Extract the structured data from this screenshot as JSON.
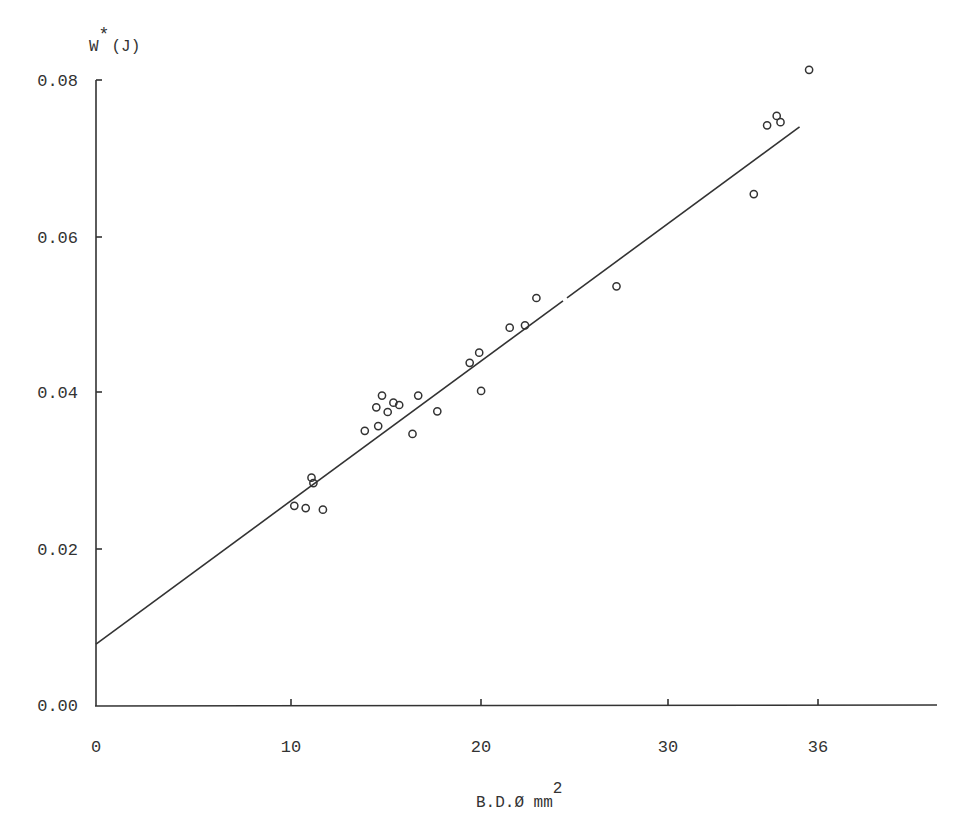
{
  "chart_data": {
    "type": "scatter",
    "title": "",
    "xlabel": "B.D.Ø mm²",
    "xlabel_main": "B.D.Ø mm",
    "xlabel_sup": "2",
    "ylabel": "W*(J)",
    "ylabel_main": "W",
    "ylabel_star": "*",
    "ylabel_unit": "(J)",
    "x_ticks": [
      {
        "label": "0",
        "value": 0,
        "px": 96
      },
      {
        "label": "10",
        "value": 10,
        "px": 291
      },
      {
        "label": "20",
        "value": 20,
        "px": 481
      },
      {
        "label": "30",
        "value": 30,
        "px": 668
      },
      {
        "label": "36",
        "value": 36,
        "px": 818
      }
    ],
    "y_ticks": [
      {
        "label": "0.00",
        "value": 0.0,
        "px": 705
      },
      {
        "label": "0.02",
        "value": 0.02,
        "px": 549
      },
      {
        "label": "0.04",
        "value": 0.04,
        "px": 392
      },
      {
        "label": "0.06",
        "value": 0.06,
        "px": 237
      },
      {
        "label": "0.08",
        "value": 0.08,
        "px": 80
      }
    ],
    "xlim": [
      0,
      44
    ],
    "ylim": [
      0.0,
      0.08
    ],
    "grid": false,
    "legend": null,
    "series": [
      {
        "name": "measurements",
        "marker": "open-circle",
        "points": [
          {
            "x": 10.4,
            "y": 0.0255
          },
          {
            "x": 11.0,
            "y": 0.0252
          },
          {
            "x": 11.9,
            "y": 0.025
          },
          {
            "x": 11.3,
            "y": 0.0291
          },
          {
            "x": 11.4,
            "y": 0.0284
          },
          {
            "x": 14.1,
            "y": 0.0351
          },
          {
            "x": 14.8,
            "y": 0.0357
          },
          {
            "x": 14.7,
            "y": 0.0381
          },
          {
            "x": 15.0,
            "y": 0.0396
          },
          {
            "x": 15.3,
            "y": 0.0375
          },
          {
            "x": 15.6,
            "y": 0.0387
          },
          {
            "x": 15.9,
            "y": 0.0384
          },
          {
            "x": 16.6,
            "y": 0.0347
          },
          {
            "x": 16.9,
            "y": 0.0396
          },
          {
            "x": 17.9,
            "y": 0.0376
          },
          {
            "x": 19.6,
            "y": 0.0438
          },
          {
            "x": 20.1,
            "y": 0.0451
          },
          {
            "x": 20.2,
            "y": 0.0402
          },
          {
            "x": 21.7,
            "y": 0.0483
          },
          {
            "x": 22.5,
            "y": 0.0486
          },
          {
            "x": 23.1,
            "y": 0.0521
          },
          {
            "x": 27.3,
            "y": 0.0536
          },
          {
            "x": 34.5,
            "y": 0.0654
          },
          {
            "x": 35.2,
            "y": 0.0742
          },
          {
            "x": 35.7,
            "y": 0.0754
          },
          {
            "x": 35.9,
            "y": 0.0746
          },
          {
            "x": 37.4,
            "y": 0.0813
          }
        ]
      },
      {
        "name": "linear-fit",
        "type": "line",
        "points": [
          {
            "x": 0,
            "y": 0.0078
          },
          {
            "x": 36.9,
            "y": 0.074
          }
        ]
      }
    ]
  }
}
